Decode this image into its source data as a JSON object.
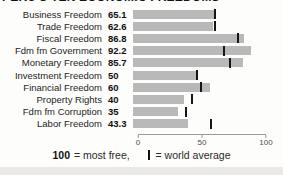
{
  "title": "PERU'S TEN ECONOMIC FREEDOMS",
  "chart_data": {
    "type": "bar",
    "orientation": "horizontal",
    "title": "PERU'S TEN ECONOMIC FREEDOMS",
    "xlabel": "",
    "ylabel": "",
    "xlim": [
      0,
      100
    ],
    "grid": false,
    "bar_color": "#b9b9b9",
    "marker_color": "#161616",
    "categories": [
      "Business Freedom",
      "Trade Freedom",
      "Fiscal Freedom",
      "Fdm fm Government",
      "Monetary Freedom",
      "Investment Freedom",
      "Financial Freedom",
      "Property Rights",
      "Fdm fm Corruption",
      "Labor Freedom"
    ],
    "values": [
      65.1,
      62.6,
      86.8,
      92.2,
      85.7,
      50,
      60,
      40,
      35,
      43.3
    ],
    "value_labels": [
      "65.1",
      "62.6",
      "86.8",
      "92.2",
      "85.7",
      "50",
      "60",
      "40",
      "35",
      "43.3"
    ],
    "world_average_markers": [
      63,
      63.5,
      81,
      70,
      75,
      49,
      52,
      45,
      40.5,
      60.5
    ],
    "legend_note": "100 = most free, | = world average"
  },
  "axis": {
    "ticks": [
      "0",
      "50",
      "100"
    ],
    "tick_positions": [
      0,
      50,
      100
    ]
  },
  "legend": {
    "scale_max": "100",
    "scale_text": "= most free,",
    "marker_text": "= world average"
  }
}
